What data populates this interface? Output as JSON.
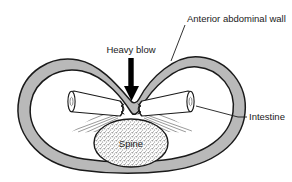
{
  "figure": {
    "colors": {
      "wall_fill": "#b9b9b9",
      "wall_stroke": "#1a1a1a",
      "cavity_fill": "#ffffff",
      "spine_fill": "#d9d9d9",
      "spine_stroke": "#1a1a1a",
      "intestine_fill": "#ffffff",
      "intestine_stroke": "#1a1a1a",
      "arrow_fill": "#000000",
      "leader_stroke": "#1a1a1a",
      "text": "#1a1a1a",
      "background": "#ffffff"
    }
  },
  "labels": {
    "anterior_wall": "Anterior abdominal wall",
    "heavy_blow": "Heavy blow",
    "intestine": "Intestine",
    "spine": "Spine"
  },
  "parts": {
    "arrow": "down-arrow",
    "spine_shape": "stippled-ellipse",
    "intestine_left": "left-intestine-tube",
    "intestine_right": "right-intestine-tube",
    "mesentery_left": "left-mesentery-hatching",
    "mesentery_right": "right-mesentery-hatching"
  }
}
